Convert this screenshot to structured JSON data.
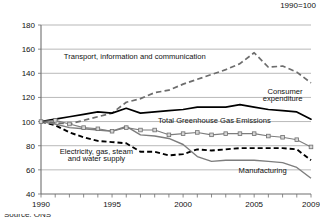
{
  "index_note": "1990=100",
  "source_note": "Source: ONS",
  "chart_data": {
    "type": "line",
    "title": "",
    "subtitle": "",
    "xlabel": "",
    "ylabel": "",
    "index_base_note": "1990=100",
    "grid": true,
    "legend_position": "inline-annotations",
    "xlim": [
      1990,
      2009
    ],
    "ylim": [
      40,
      180
    ],
    "ytick_values": [
      40,
      60,
      80,
      100,
      120,
      140,
      160,
      180
    ],
    "ytick_labels": [
      "40",
      "60",
      "80",
      "100",
      "120",
      "140",
      "160",
      "180"
    ],
    "xtick_values": [
      1990,
      1995,
      2000,
      2005,
      2009
    ],
    "xtick_labels": [
      "1990",
      "1995",
      "2000",
      "2005",
      "2009"
    ],
    "x": [
      1990,
      1991,
      1992,
      1993,
      1994,
      1995,
      1996,
      1997,
      1998,
      1999,
      2000,
      2001,
      2002,
      2003,
      2004,
      2005,
      2006,
      2007,
      2008,
      2009
    ],
    "series": [
      {
        "name": "Transport, information and communication",
        "style": "dashed-grey",
        "label": "Transport, information and communication",
        "values": [
          100,
          99,
          98,
          101,
          104,
          107,
          116,
          119,
          124,
          126,
          131,
          135,
          139,
          143,
          148,
          157,
          145,
          146,
          141,
          132
        ]
      },
      {
        "name": "Consumer expenditure",
        "style": "solid-black",
        "label": "Consumer expenditure",
        "values": [
          100,
          102,
          104,
          106,
          108,
          107,
          111,
          107,
          108,
          109,
          110,
          112,
          112,
          112,
          114,
          112,
          110,
          109,
          108,
          102
        ]
      },
      {
        "name": "Total Greenhouse Gas Emissions",
        "style": "solid-grey-markers",
        "label": "Total Greenhouse Gas Emissions",
        "values": [
          100,
          101,
          98,
          95,
          94,
          92,
          95,
          93,
          93,
          89,
          90,
          91,
          89,
          90,
          90,
          90,
          88,
          87,
          85,
          79
        ]
      },
      {
        "name": "Electricity, gas, steam and water supply",
        "style": "dashed-black",
        "label": "Electricity, gas, steam and water supply",
        "values": [
          100,
          97,
          91,
          87,
          84,
          83,
          82,
          75,
          75,
          72,
          73,
          77,
          76,
          77,
          78,
          78,
          78,
          78,
          77,
          68
        ]
      },
      {
        "name": "Manufacturing",
        "style": "solid-grey",
        "label": "Manufacturing",
        "values": [
          100,
          98,
          95,
          94,
          93,
          92,
          96,
          89,
          88,
          86,
          81,
          71,
          67,
          68,
          68,
          68,
          67,
          66,
          62,
          53
        ]
      }
    ],
    "annotations": [
      {
        "text": "Transport, information and communication",
        "x": 1996.6,
        "y": 152
      },
      {
        "text": "Consumer",
        "x": 2008.4,
        "y": 123
      },
      {
        "text": "expenditure",
        "x": 2008.4,
        "y": 117
      },
      {
        "text": "Total Greenhouse Gas Emissions",
        "x": 2002.2,
        "y": 99
      },
      {
        "text": "Electricity, gas, steam",
        "x": 1993.9,
        "y": 73
      },
      {
        "text": "and water supply",
        "x": 1993.9,
        "y": 67
      },
      {
        "text": "Manufacturing",
        "x": 2005.6,
        "y": 57
      }
    ]
  }
}
